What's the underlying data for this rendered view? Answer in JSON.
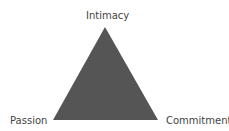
{
  "diagram": {
    "vertices": {
      "top": "Intimacy",
      "bottom_left": "Passion",
      "bottom_right": "Commitment"
    },
    "fill_color": "#555555"
  }
}
